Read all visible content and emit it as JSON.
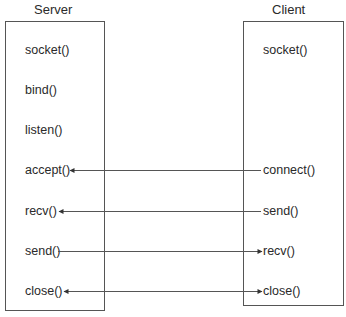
{
  "server": {
    "title": "Server",
    "calls": [
      "socket()",
      "bind()",
      "listen()",
      "accept()",
      "recv()",
      "send()",
      "close()"
    ]
  },
  "client": {
    "title": "Client",
    "calls": [
      "socket()",
      "connect()",
      "send()",
      "recv()",
      "close()"
    ]
  },
  "arrows": [
    {
      "from": "client.connect()",
      "to": "server.accept()",
      "direction": "client-to-server"
    },
    {
      "from": "client.send()",
      "to": "server.recv()",
      "direction": "client-to-server"
    },
    {
      "from": "server.send()",
      "to": "client.recv()",
      "direction": "server-to-client"
    },
    {
      "from": "server.close()",
      "to": "client.close()",
      "direction": "bidirectional"
    }
  ],
  "colors": {
    "line": "#555555",
    "text": "#2a2a2a"
  }
}
